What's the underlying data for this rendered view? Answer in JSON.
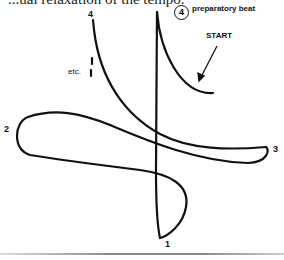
{
  "header": {
    "text": "...ual relaxation of the tempo."
  },
  "diagram": {
    "beats": {
      "beat1": "1",
      "beat2": "2",
      "beat3": "3",
      "beat4": "4",
      "prep_beat_number": "4"
    },
    "annotations": {
      "prep_label": "preparatory beat",
      "start_label": "START",
      "etc_label": "etc."
    },
    "colors": {
      "stroke": "#111111",
      "background": "#ffffff"
    }
  }
}
